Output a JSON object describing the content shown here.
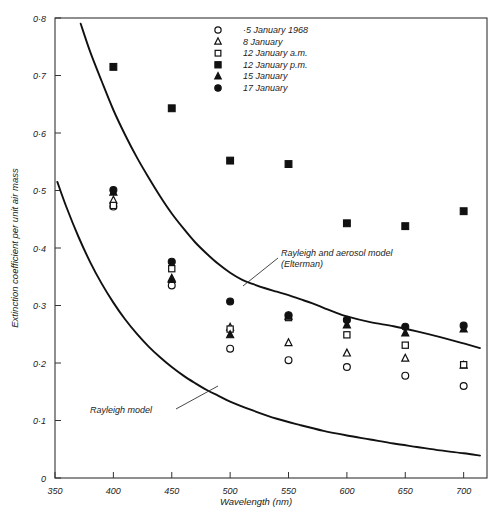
{
  "chart_data": {
    "type": "scatter",
    "title": "",
    "xlabel": "Wavelength (nm)",
    "ylabel": "Extinction coefficient per unit air mass",
    "xlim": [
      350,
      720
    ],
    "ylim": [
      0,
      0.8
    ],
    "grid": false,
    "legend_position": "top-center",
    "xticks": [
      350,
      400,
      450,
      500,
      550,
      600,
      650,
      700
    ],
    "xtick_labels": [
      "350",
      "400",
      "450",
      "500",
      "550",
      "600",
      "650",
      "700"
    ],
    "yticks": [
      0,
      0.1,
      0.2,
      0.3,
      0.4,
      0.5,
      0.6,
      0.7,
      0.8
    ],
    "ytick_labels": [
      "0",
      "0·1",
      "0·2",
      "0·3",
      "0·4",
      "0·5",
      "0·6",
      "0·7",
      "0·8"
    ],
    "x": [
      400,
      450,
      500,
      550,
      600,
      650,
      700
    ],
    "series": [
      {
        "name": "5 January 1968",
        "marker": "open-circle",
        "values": [
          0.472,
          0.335,
          0.225,
          0.205,
          0.193,
          0.178,
          0.16
        ]
      },
      {
        "name": "8 January",
        "marker": "open-triangle",
        "values": [
          0.483,
          0.347,
          0.262,
          0.235,
          0.217,
          0.208,
          0.196
        ]
      },
      {
        "name": "12 January a.m.",
        "marker": "open-square",
        "values": [
          0.474,
          0.364,
          0.259,
          0.279,
          0.249,
          0.231,
          0.197
        ]
      },
      {
        "name": "12 January p.m.",
        "marker": "filled-square",
        "values": [
          0.715,
          0.643,
          0.552,
          0.546,
          0.443,
          0.438,
          0.464
        ]
      },
      {
        "name": "15 January",
        "marker": "filled-triangle",
        "values": [
          0.497,
          0.345,
          0.249,
          0.281,
          0.266,
          0.252,
          0.259
        ]
      },
      {
        "name": "17 January",
        "marker": "filled-circle",
        "values": [
          0.501,
          0.376,
          0.307,
          0.283,
          0.275,
          0.263,
          0.265
        ]
      }
    ],
    "model_curves": [
      {
        "name": "Rayleigh and aerosol model (Elterman)",
        "annotation": "Rayleigh and aerosol model",
        "annotation_sub": "(Elterman)",
        "points": [
          [
            372,
            0.79
          ],
          [
            380,
            0.742
          ],
          [
            390,
            0.69
          ],
          [
            400,
            0.64
          ],
          [
            410,
            0.597
          ],
          [
            420,
            0.558
          ],
          [
            430,
            0.523
          ],
          [
            440,
            0.49
          ],
          [
            450,
            0.46
          ],
          [
            460,
            0.434
          ],
          [
            470,
            0.41
          ],
          [
            480,
            0.39
          ],
          [
            490,
            0.372
          ],
          [
            500,
            0.357
          ],
          [
            510,
            0.345
          ],
          [
            520,
            0.337
          ],
          [
            530,
            0.33
          ],
          [
            540,
            0.324
          ],
          [
            550,
            0.318
          ],
          [
            560,
            0.311
          ],
          [
            570,
            0.304
          ],
          [
            580,
            0.296
          ],
          [
            590,
            0.288
          ],
          [
            600,
            0.281
          ],
          [
            620,
            0.271
          ],
          [
            640,
            0.264
          ],
          [
            660,
            0.255
          ],
          [
            680,
            0.245
          ],
          [
            700,
            0.234
          ],
          [
            714,
            0.226
          ]
        ]
      },
      {
        "name": "Rayleigh model",
        "annotation": "Rayleigh model",
        "annotation_sub": "",
        "points": [
          [
            352,
            0.515
          ],
          [
            360,
            0.47
          ],
          [
            370,
            0.42
          ],
          [
            380,
            0.376
          ],
          [
            390,
            0.338
          ],
          [
            400,
            0.305
          ],
          [
            410,
            0.276
          ],
          [
            420,
            0.251
          ],
          [
            430,
            0.229
          ],
          [
            440,
            0.21
          ],
          [
            450,
            0.193
          ],
          [
            460,
            0.178
          ],
          [
            470,
            0.165
          ],
          [
            480,
            0.153
          ],
          [
            490,
            0.143
          ],
          [
            500,
            0.133
          ],
          [
            520,
            0.117
          ],
          [
            540,
            0.103
          ],
          [
            560,
            0.092
          ],
          [
            580,
            0.082
          ],
          [
            600,
            0.074
          ],
          [
            620,
            0.067
          ],
          [
            640,
            0.06
          ],
          [
            660,
            0.054
          ],
          [
            680,
            0.048
          ],
          [
            700,
            0.043
          ],
          [
            714,
            0.039
          ]
        ]
      }
    ]
  },
  "legend": {
    "items": [
      {
        "marker": "open-circle",
        "label": "5 January 1968"
      },
      {
        "marker": "open-triangle",
        "label": "8 January"
      },
      {
        "marker": "open-square",
        "label": "12 January a.m."
      },
      {
        "marker": "filled-square",
        "label": "12 January p.m."
      },
      {
        "marker": "filled-triangle",
        "label": "15 January"
      },
      {
        "marker": "filled-circle",
        "label": "17 January"
      }
    ]
  },
  "annotations": [
    {
      "text": "Rayleigh and aerosol model",
      "sub": "(Elterman)"
    },
    {
      "text": "Rayleigh model",
      "sub": ""
    }
  ],
  "colors": {
    "ink": "#111111",
    "axis": "#333333",
    "background": "#ffffff"
  }
}
